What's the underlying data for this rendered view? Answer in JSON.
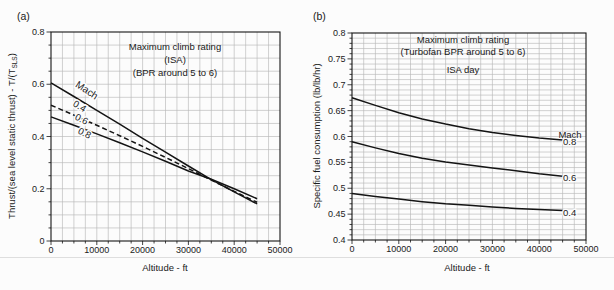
{
  "chart_data": [
    {
      "type": "line",
      "panel_tag": "(a)",
      "title_lines": [
        "Maximum climb rating",
        "(ISA)",
        "(BPR around 5 to 6)"
      ],
      "xlabel": "Altitude - ft",
      "ylabel": "Thrust/(sea level static thrust) - T/(T_SLS)",
      "ylabel_parts": [
        {
          "t": "Thrust/(sea level static thrust) - T/(T"
        },
        {
          "t": "SLS",
          "sub": true
        },
        {
          "t": ")"
        }
      ],
      "xlim": [
        0,
        50000
      ],
      "ylim": [
        0,
        0.8
      ],
      "x_major_step": 10000,
      "x_minor_step": 2500,
      "y_major_step": 0.2,
      "y_minor_step": 0.05,
      "x_tick_labels": [
        "0",
        "10000",
        "20000",
        "30000",
        "40000",
        "50000"
      ],
      "y_tick_labels": [
        "0",
        "0.2",
        "0.4",
        "0.6",
        "0.8"
      ],
      "grid": true,
      "legend": {
        "header": "Mach",
        "placement": "inline"
      },
      "x": [
        0,
        5000,
        10000,
        15000,
        20000,
        25000,
        30000,
        35000,
        40000,
        45000
      ],
      "series": [
        {
          "name": "0.4",
          "style": "solid",
          "values": [
            0.605,
            0.553,
            0.5,
            0.447,
            0.393,
            0.34,
            0.287,
            0.235,
            0.188,
            0.142
          ]
        },
        {
          "name": "0.6",
          "style": "dashed",
          "values": [
            0.52,
            0.482,
            0.443,
            0.403,
            0.362,
            0.32,
            0.277,
            0.233,
            0.19,
            0.148
          ]
        },
        {
          "name": "0.8",
          "style": "solid",
          "values": [
            0.475,
            0.443,
            0.41,
            0.376,
            0.341,
            0.305,
            0.268,
            0.236,
            0.2,
            0.162
          ]
        }
      ]
    },
    {
      "type": "line",
      "panel_tag": "(b)",
      "title_lines": [
        "Maximum climb rating",
        "(Turbofan BPR around 5 to 6)",
        "ISA day"
      ],
      "xlabel": "Altitude - ft",
      "ylabel": "Specific fuel consumption (lb/lb/hr)",
      "ylabel_parts": [
        {
          "t": "Specific fuel consumption (lb/lb/hr)"
        }
      ],
      "xlim": [
        0,
        50000
      ],
      "ylim": [
        0.4,
        0.8
      ],
      "x_major_step": 10000,
      "x_minor_step": 2500,
      "y_major_step": 0.05,
      "y_minor_step": 0.01,
      "x_tick_labels": [
        "0",
        "10000",
        "20000",
        "30000",
        "40000",
        "50000"
      ],
      "y_tick_labels": [
        "0.4",
        "0.45",
        "0.5",
        "0.55",
        "0.6",
        "0.65",
        "0.7",
        "0.75",
        "0.8"
      ],
      "grid": true,
      "legend": {
        "header": "Mach",
        "placement": "right-end"
      },
      "x": [
        0,
        5000,
        10000,
        15000,
        20000,
        25000,
        30000,
        35000,
        40000,
        45000
      ],
      "series": [
        {
          "name": "0.8",
          "style": "solid",
          "values": [
            0.675,
            0.66,
            0.646,
            0.634,
            0.624,
            0.615,
            0.608,
            0.602,
            0.597,
            0.593
          ]
        },
        {
          "name": "0.6",
          "style": "solid",
          "values": [
            0.59,
            0.578,
            0.567,
            0.558,
            0.551,
            0.545,
            0.539,
            0.534,
            0.528,
            0.523
          ]
        },
        {
          "name": "0.4",
          "style": "solid",
          "values": [
            0.49,
            0.484,
            0.479,
            0.474,
            0.47,
            0.467,
            0.464,
            0.461,
            0.459,
            0.457
          ]
        }
      ]
    }
  ]
}
